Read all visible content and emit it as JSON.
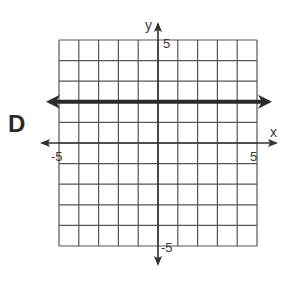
{
  "option_label": "D",
  "chart_data": {
    "type": "line",
    "title": "",
    "xlabel": "x",
    "ylabel": "y",
    "xlim": [
      -5,
      5
    ],
    "ylim": [
      -5,
      5
    ],
    "grid": true,
    "grid_step": 1,
    "tick_labels": {
      "x_min": "-5",
      "x_max": "5",
      "y_min": "-5",
      "y_max": "5"
    },
    "series": [
      {
        "name": "horizontal line",
        "equation": "y = 2",
        "x": [
          -5,
          5
        ],
        "y": [
          2,
          2
        ],
        "arrows_both_ends": true,
        "color": "#2a2a2a"
      }
    ]
  },
  "colors": {
    "grid": "#555555",
    "axes": "#333333",
    "line": "#2a2a2a"
  }
}
